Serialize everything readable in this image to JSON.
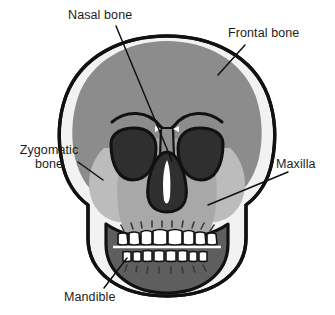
{
  "diagram": {
    "view": "anterior (front) view",
    "style": "flat grayscale illustration with black outlines and leader lines"
  },
  "labels": [
    {
      "id": "nasal-bone",
      "text": "Nasal bone",
      "position": "top-left",
      "leader": "long diagonal line from label down-right to the nasal bridge between the eye sockets"
    },
    {
      "id": "frontal-bone",
      "text": "Frontal bone",
      "position": "top-right",
      "leader": "short diagonal line from label down-left to the upper right cranium"
    },
    {
      "id": "zygomatic-bone",
      "text": "Zygomatic\nbone",
      "line1": "Zygomatic",
      "line2": "bone",
      "position": "middle-left",
      "leader": "short diagonal line from label right-down to the left cheekbone"
    },
    {
      "id": "maxilla",
      "text": "Maxilla",
      "position": "middle-right",
      "leader": "long diagonal line from label down-left to the right upper jaw"
    },
    {
      "id": "mandible",
      "text": "Mandible",
      "position": "bottom-left",
      "leader": "short diagonal line from label up-right to the left lower jaw"
    }
  ],
  "regions": [
    {
      "name": "cranium-outline",
      "fill": "#8c8c8c",
      "stroke": "#111111"
    },
    {
      "name": "temporal-highlight",
      "fill": "#f2f2f2"
    },
    {
      "name": "frontal-bone",
      "fill": "#8c8c8c"
    },
    {
      "name": "zygomatic-bone",
      "fill": "#bcbcbc"
    },
    {
      "name": "maxilla",
      "fill": "#a8a8a8"
    },
    {
      "name": "mandible",
      "fill": "#5e5e5e"
    },
    {
      "name": "eye-socket",
      "fill": "#2f2f2f"
    },
    {
      "name": "nasal-aperture",
      "fill": "#2f2f2f"
    },
    {
      "name": "nasal-septum-highlight",
      "fill": "#ffffff"
    },
    {
      "name": "teeth",
      "fill": "#ffffff"
    }
  ],
  "colors": {
    "outline": "#111111",
    "cranium_gray": "#8c8c8c",
    "maxilla_gray": "#a8a8a8",
    "zygomatic_gray": "#bcbcbc",
    "mandible_gray": "#5e5e5e",
    "cavity_dark": "#2f2f2f",
    "highlight_white": "#f2f2f2",
    "teeth_white": "#ffffff",
    "label_text": "#1c1c1c",
    "background": "#ffffff"
  },
  "teeth": {
    "upper_count": 10,
    "lower_count": 12,
    "upper_row_label": "maxillary teeth",
    "lower_row_label": "mandibular teeth"
  }
}
